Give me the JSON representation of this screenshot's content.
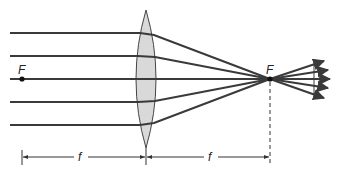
{
  "diagram": {
    "labels": {
      "focal_point_left": "F",
      "focal_point_right": "F",
      "focal_length_left": "f",
      "focal_length_right": "f"
    },
    "colors": {
      "ray": "#3a3a3a",
      "lens_fill": "#d9d9d9",
      "lens_stroke": "#444444",
      "dimension": "#333333",
      "background": "#ffffff"
    },
    "rays": [
      {
        "y_in": 33
      },
      {
        "y_in": 56
      },
      {
        "y_in": 79
      },
      {
        "y_in": 102
      },
      {
        "y_in": 125
      }
    ],
    "lens": {
      "cx": 146,
      "top": 10,
      "bottom": 148,
      "half_width": 10
    },
    "focal_points": {
      "left": {
        "x": 22,
        "y": 79
      },
      "right": {
        "x": 270,
        "y": 79
      }
    }
  }
}
